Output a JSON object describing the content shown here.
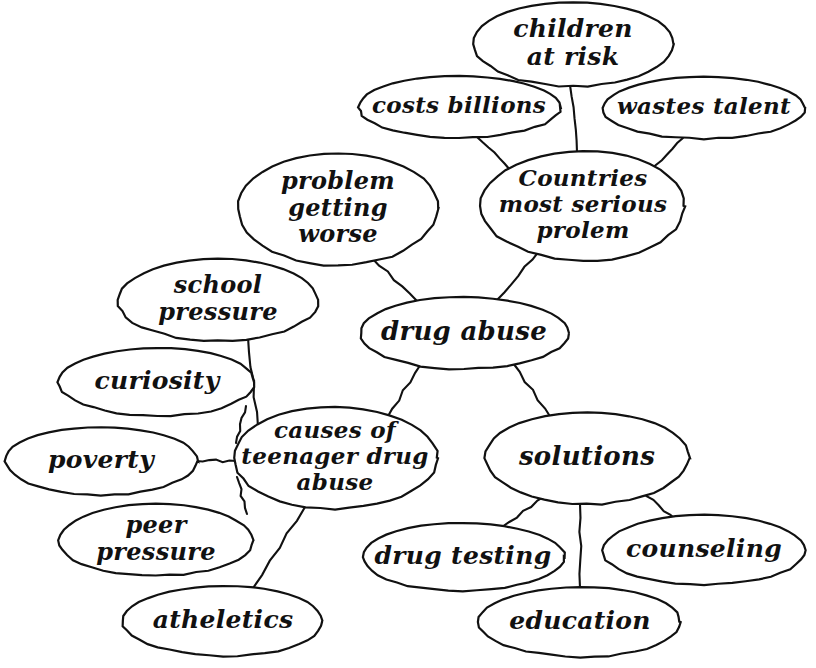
{
  "diagram": {
    "style": "hand-drawn cursive ellipse concept map",
    "background_color": "#ffffff",
    "ink_color": "#111111",
    "nodes": [
      {
        "id": "children_at_risk",
        "label": "children\nat risk",
        "lines": [
          "children",
          "at risk"
        ],
        "cx": 573,
        "cy": 44,
        "rx": 100,
        "ry": 42,
        "font_size": 25
      },
      {
        "id": "costs_billions",
        "label": "costs billions",
        "lines": [
          "costs billions"
        ],
        "cx": 459,
        "cy": 107,
        "rx": 101,
        "ry": 31,
        "font_size": 23
      },
      {
        "id": "wastes_talent",
        "label": "wastes talent",
        "lines": [
          "wastes talent"
        ],
        "cx": 704,
        "cy": 108,
        "rx": 101,
        "ry": 31,
        "font_size": 23
      },
      {
        "id": "countries_most_serious_prolem",
        "label": "Countries\nmost serious\nprolem",
        "lines": [
          "Countries",
          "most serious",
          "prolem"
        ],
        "cx": 583,
        "cy": 206,
        "rx": 102,
        "ry": 55,
        "font_size": 23
      },
      {
        "id": "problem_getting_worse",
        "label": "problem\ngetting\nworse",
        "lines": [
          "problem",
          "getting",
          "worse"
        ],
        "cx": 338,
        "cy": 209,
        "rx": 100,
        "ry": 56,
        "font_size": 24
      },
      {
        "id": "drug_abuse",
        "label": "drug abuse",
        "lines": [
          "drug abuse"
        ],
        "cx": 464,
        "cy": 333,
        "rx": 104,
        "ry": 36,
        "font_size": 26
      },
      {
        "id": "school_pressure",
        "label": "school\npressure",
        "lines": [
          "school",
          "pressure"
        ],
        "cx": 218,
        "cy": 300,
        "rx": 100,
        "ry": 41,
        "font_size": 24
      },
      {
        "id": "curiosity",
        "label": "curiosity",
        "lines": [
          "curiosity"
        ],
        "cx": 157,
        "cy": 382,
        "rx": 98,
        "ry": 34,
        "font_size": 25
      },
      {
        "id": "poverty",
        "label": "poverty",
        "lines": [
          "poverty"
        ],
        "cx": 101,
        "cy": 461,
        "rx": 96,
        "ry": 34,
        "font_size": 25
      },
      {
        "id": "causes_of_teenager_drug_abuse",
        "label": "causes of\nteenager drug\nabuse",
        "lines": [
          "causes of",
          "teenager drug",
          "abuse"
        ],
        "cx": 335,
        "cy": 458,
        "rx": 102,
        "ry": 51,
        "font_size": 23
      },
      {
        "id": "peer_pressure",
        "label": "peer\npressure",
        "lines": [
          "peer",
          "pressure"
        ],
        "cx": 156,
        "cy": 540,
        "rx": 97,
        "ry": 36,
        "font_size": 24
      },
      {
        "id": "atheletics",
        "label": "atheletics",
        "lines": [
          "atheletics"
        ],
        "cx": 223,
        "cy": 621,
        "rx": 100,
        "ry": 35,
        "font_size": 25
      },
      {
        "id": "solutions",
        "label": "solutions",
        "lines": [
          "solutions"
        ],
        "cx": 587,
        "cy": 458,
        "rx": 102,
        "ry": 46,
        "font_size": 26
      },
      {
        "id": "drug_testing",
        "label": "drug testing",
        "lines": [
          "drug testing"
        ],
        "cx": 463,
        "cy": 557,
        "rx": 101,
        "ry": 34,
        "font_size": 25
      },
      {
        "id": "counseling",
        "label": "counseling",
        "lines": [
          "counseling"
        ],
        "cx": 704,
        "cy": 550,
        "rx": 101,
        "ry": 35,
        "font_size": 25
      },
      {
        "id": "education",
        "label": "education",
        "lines": [
          "education"
        ],
        "cx": 580,
        "cy": 622,
        "rx": 101,
        "ry": 35,
        "font_size": 25
      }
    ],
    "edges": [
      {
        "id": "e-countries-children",
        "from": "countries_most_serious_prolem",
        "to": "children_at_risk",
        "x1": 577,
        "y1": 152,
        "x2": 570,
        "y2": 85
      },
      {
        "id": "e-countries-costs",
        "from": "countries_most_serious_prolem",
        "to": "costs_billions",
        "x1": 510,
        "y1": 170,
        "x2": 477,
        "y2": 137
      },
      {
        "id": "e-countries-wastes",
        "from": "countries_most_serious_prolem",
        "to": "wastes_talent",
        "x1": 650,
        "y1": 170,
        "x2": 683,
        "y2": 138
      },
      {
        "id": "e-drugabuse-countries",
        "from": "drug_abuse",
        "to": "countries_most_serious_prolem",
        "x1": 497,
        "y1": 300,
        "x2": 539,
        "y2": 251
      },
      {
        "id": "e-drugabuse-problemworse",
        "from": "drug_abuse",
        "to": "problem_getting_worse",
        "x1": 417,
        "y1": 301,
        "x2": 372,
        "y2": 258
      },
      {
        "id": "e-drugabuse-causes",
        "from": "drug_abuse",
        "to": "causes_of_teenager_drug_abuse",
        "x1": 421,
        "y1": 364,
        "x2": 387,
        "y2": 418
      },
      {
        "id": "e-drugabuse-solutions",
        "from": "drug_abuse",
        "to": "solutions",
        "x1": 513,
        "y1": 363,
        "x2": 551,
        "y2": 418
      },
      {
        "id": "e-causes-school",
        "from": "causes_of_teenager_drug_abuse",
        "to": "school_pressure",
        "x1": 258,
        "y1": 427,
        "x2": 248,
        "y2": 337
      },
      {
        "id": "e-causes-curiosity",
        "from": "causes_of_teenager_drug_abuse",
        "to": "curiosity",
        "x1": 236,
        "y1": 443,
        "x2": 246,
        "y2": 406
      },
      {
        "id": "e-causes-poverty",
        "from": "causes_of_teenager_drug_abuse",
        "to": "poverty",
        "x1": 196,
        "y1": 461,
        "x2": 236,
        "y2": 461
      },
      {
        "id": "e-causes-peer",
        "from": "causes_of_teenager_drug_abuse",
        "to": "peer_pressure",
        "x1": 237,
        "y1": 477,
        "x2": 247,
        "y2": 514
      },
      {
        "id": "e-causes-atheletics",
        "from": "causes_of_teenager_drug_abuse",
        "to": "atheletics",
        "x1": 305,
        "y1": 507,
        "x2": 253,
        "y2": 588
      },
      {
        "id": "e-solutions-drugtesting",
        "from": "solutions",
        "to": "drug_testing",
        "x1": 545,
        "y1": 496,
        "x2": 502,
        "y2": 527
      },
      {
        "id": "e-solutions-education",
        "from": "solutions",
        "to": "education",
        "x1": 580,
        "y1": 504,
        "x2": 580,
        "y2": 588
      },
      {
        "id": "e-solutions-counseling",
        "from": "solutions",
        "to": "counseling",
        "x1": 641,
        "y1": 491,
        "x2": 676,
        "y2": 520
      }
    ]
  }
}
